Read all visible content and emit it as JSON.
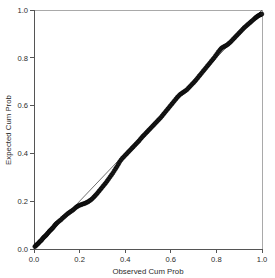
{
  "chart_data": {
    "type": "scatter",
    "title": "",
    "subtitle": "",
    "xlabel": "Observed Cum Prob",
    "ylabel": "Expected Cum Prob",
    "xlim": [
      0.0,
      1.0
    ],
    "ylim": [
      0.0,
      1.0
    ],
    "xticks": [
      "0.0",
      "0.2",
      "0.4",
      "0.6",
      "0.8",
      "1.0"
    ],
    "yticks": [
      "0.0",
      "0.2",
      "0.4",
      "0.6",
      "0.8",
      "1.0"
    ],
    "xtick_values": [
      0.0,
      0.2,
      0.4,
      0.6,
      0.8,
      1.0
    ],
    "ytick_values": [
      0.0,
      0.2,
      0.4,
      0.6,
      0.8,
      1.0
    ],
    "grid": false,
    "legend": false,
    "legend_position": "none",
    "marker": "circle",
    "marker_color": "#1a1a1a",
    "reference_line_color": "#4a4a4a",
    "frame_color": "#a9a9a9",
    "series": [
      {
        "name": "Observed vs Expected",
        "x": [
          0.004,
          0.008,
          0.012,
          0.016,
          0.02,
          0.024,
          0.028,
          0.032,
          0.036,
          0.04,
          0.044,
          0.048,
          0.052,
          0.056,
          0.06,
          0.064,
          0.068,
          0.072,
          0.076,
          0.08,
          0.084,
          0.088,
          0.092,
          0.096,
          0.1,
          0.106,
          0.112,
          0.118,
          0.124,
          0.13,
          0.136,
          0.142,
          0.148,
          0.154,
          0.16,
          0.166,
          0.172,
          0.178,
          0.184,
          0.19,
          0.196,
          0.202,
          0.208,
          0.214,
          0.22,
          0.226,
          0.232,
          0.238,
          0.244,
          0.25,
          0.256,
          0.262,
          0.268,
          0.274,
          0.28,
          0.286,
          0.292,
          0.298,
          0.304,
          0.31,
          0.316,
          0.322,
          0.328,
          0.334,
          0.34,
          0.346,
          0.352,
          0.358,
          0.364,
          0.37,
          0.376,
          0.382,
          0.388,
          0.394,
          0.4,
          0.406,
          0.412,
          0.418,
          0.424,
          0.43,
          0.436,
          0.442,
          0.448,
          0.454,
          0.46,
          0.466,
          0.472,
          0.478,
          0.484,
          0.49,
          0.496,
          0.502,
          0.508,
          0.514,
          0.52,
          0.526,
          0.532,
          0.538,
          0.544,
          0.55,
          0.556,
          0.562,
          0.568,
          0.574,
          0.58,
          0.586,
          0.592,
          0.598,
          0.604,
          0.61,
          0.616,
          0.622,
          0.628,
          0.634,
          0.64,
          0.646,
          0.652,
          0.658,
          0.664,
          0.67,
          0.676,
          0.682,
          0.688,
          0.694,
          0.7,
          0.706,
          0.712,
          0.718,
          0.724,
          0.73,
          0.736,
          0.742,
          0.748,
          0.754,
          0.76,
          0.766,
          0.772,
          0.778,
          0.784,
          0.79,
          0.796,
          0.802,
          0.808,
          0.814,
          0.82,
          0.826,
          0.832,
          0.838,
          0.844,
          0.85,
          0.856,
          0.862,
          0.868,
          0.874,
          0.88,
          0.886,
          0.892,
          0.898,
          0.904,
          0.91,
          0.916,
          0.922,
          0.928,
          0.934,
          0.94,
          0.946,
          0.952,
          0.958,
          0.964,
          0.97,
          0.974,
          0.978,
          0.982,
          0.986,
          0.99,
          0.993,
          0.996,
          0.999
        ],
        "y": [
          0.01,
          0.014,
          0.018,
          0.021,
          0.025,
          0.029,
          0.033,
          0.036,
          0.041,
          0.046,
          0.05,
          0.053,
          0.057,
          0.061,
          0.066,
          0.07,
          0.075,
          0.078,
          0.082,
          0.086,
          0.09,
          0.095,
          0.1,
          0.104,
          0.108,
          0.113,
          0.118,
          0.122,
          0.128,
          0.133,
          0.138,
          0.143,
          0.148,
          0.152,
          0.156,
          0.16,
          0.164,
          0.169,
          0.174,
          0.178,
          0.181,
          0.184,
          0.186,
          0.188,
          0.19,
          0.192,
          0.195,
          0.198,
          0.202,
          0.206,
          0.211,
          0.217,
          0.223,
          0.229,
          0.236,
          0.243,
          0.25,
          0.257,
          0.264,
          0.271,
          0.278,
          0.286,
          0.294,
          0.302,
          0.31,
          0.318,
          0.327,
          0.336,
          0.345,
          0.355,
          0.365,
          0.373,
          0.38,
          0.386,
          0.392,
          0.398,
          0.404,
          0.41,
          0.416,
          0.422,
          0.428,
          0.434,
          0.44,
          0.446,
          0.452,
          0.459,
          0.466,
          0.472,
          0.478,
          0.484,
          0.49,
          0.496,
          0.502,
          0.508,
          0.514,
          0.52,
          0.526,
          0.532,
          0.538,
          0.544,
          0.55,
          0.557,
          0.564,
          0.571,
          0.578,
          0.585,
          0.592,
          0.599,
          0.606,
          0.613,
          0.62,
          0.627,
          0.634,
          0.64,
          0.646,
          0.65,
          0.654,
          0.658,
          0.662,
          0.666,
          0.672,
          0.678,
          0.684,
          0.69,
          0.696,
          0.702,
          0.709,
          0.716,
          0.723,
          0.73,
          0.737,
          0.744,
          0.751,
          0.758,
          0.765,
          0.772,
          0.779,
          0.786,
          0.793,
          0.8,
          0.808,
          0.816,
          0.824,
          0.831,
          0.838,
          0.843,
          0.846,
          0.849,
          0.852,
          0.856,
          0.861,
          0.866,
          0.872,
          0.878,
          0.884,
          0.89,
          0.896,
          0.902,
          0.908,
          0.914,
          0.92,
          0.926,
          0.931,
          0.936,
          0.941,
          0.946,
          0.951,
          0.956,
          0.961,
          0.966,
          0.969,
          0.972,
          0.975,
          0.977,
          0.979,
          0.981,
          0.982,
          0.983
        ]
      }
    ],
    "reference_line": {
      "name": "reference-diagonal",
      "x": [
        0.0,
        1.0
      ],
      "y": [
        0.0,
        1.0
      ]
    }
  }
}
